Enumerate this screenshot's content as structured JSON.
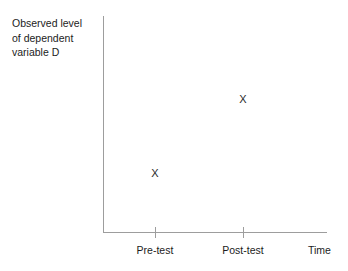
{
  "chart_data": {
    "type": "scatter",
    "title": "",
    "xlabel": "Time",
    "ylabel": "Observed level of dependent variable D",
    "categories": [
      "Pre-test",
      "Post-test"
    ],
    "marker": "X",
    "series": [
      {
        "name": "Observed level of dependent variable D",
        "points": [
          {
            "x": "Pre-test",
            "y": 0.28,
            "marker": "X"
          },
          {
            "x": "Post-test",
            "y": 0.62,
            "marker": "X"
          }
        ],
        "values": [
          0.28,
          0.62
        ]
      }
    ],
    "xlim": [
      0,
      1
    ],
    "ylim": [
      0,
      1
    ],
    "grid": false,
    "legend": false,
    "axis_color": "#9d9d9d",
    "marker_color": "#2b2b2b",
    "text_color": "#1c1c1c",
    "background": "#ffffff"
  },
  "y_axis": {
    "caption_lines": [
      "Observed level",
      "of dependent",
      "variable D"
    ]
  },
  "x_axis": {
    "ticks": [
      {
        "label": "Pre-test"
      },
      {
        "label": "Post-test"
      }
    ],
    "axis_title": "Time"
  },
  "markers": {
    "pretest": "X",
    "posttest": "X"
  }
}
